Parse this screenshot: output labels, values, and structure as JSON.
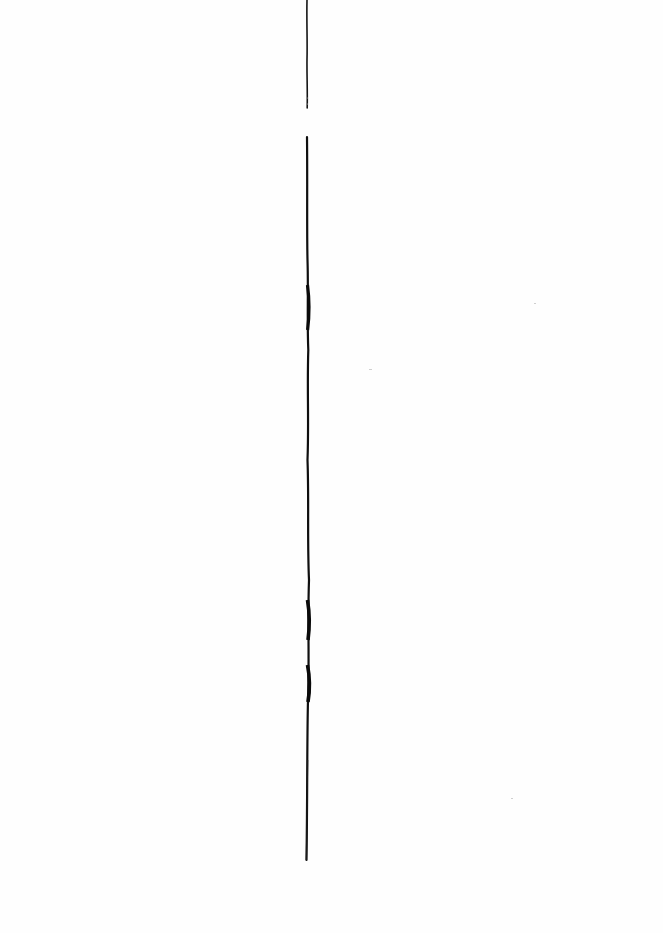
{
  "page": {
    "background": "#fefefe"
  },
  "line": {
    "color": "#111111",
    "segments": [
      {
        "y_start": 0,
        "y_end": 108
      },
      {
        "y_start": 137,
        "y_end": 860
      }
    ],
    "x": 307
  }
}
